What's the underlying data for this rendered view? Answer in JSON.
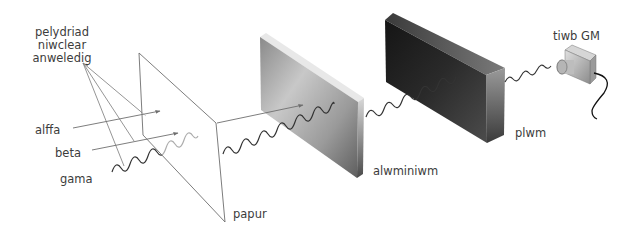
{
  "diagram": {
    "type": "radiation-penetration",
    "labels": {
      "source": [
        "pelydriad",
        "niwclear",
        "anweledig"
      ],
      "alpha": "alffa",
      "beta": "beta",
      "gamma": "gama",
      "paper": "papur",
      "aluminium": "alwminiwm",
      "lead": "plwm",
      "detector": "tiwb GM"
    },
    "colors": {
      "line": "#6e6e6e",
      "wave": "#333333",
      "text": "#3c3c3c",
      "aluminium_light": "#f2f2f2",
      "aluminium_dark": "#6a6a6a",
      "lead_light": "#5a5a5a",
      "lead_dark": "#0e0e0e"
    }
  }
}
